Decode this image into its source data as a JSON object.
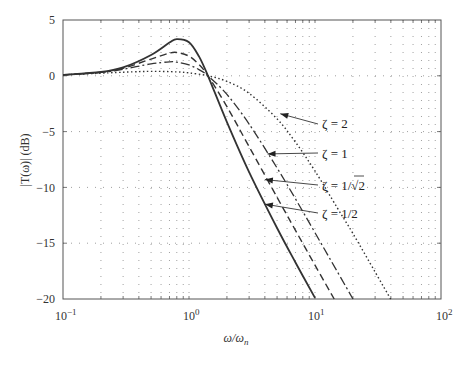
{
  "chart_data": {
    "type": "line",
    "title": "",
    "xlabel": "ω/ωn",
    "ylabel": "|T(ω)| (dB)",
    "xscale": "log",
    "xlim": [
      0.1,
      100
    ],
    "ylim": [
      -20,
      5
    ],
    "grid": true,
    "x_ticks": [
      "10^-1",
      "10^0",
      "10^1",
      "10^2"
    ],
    "y_ticks": [
      "5",
      "0",
      "-5",
      "-10",
      "-15",
      "-20"
    ],
    "series": [
      {
        "name": "ζ = 2",
        "style": "dotted",
        "x": [
          0.1,
          0.3,
          0.5,
          0.8,
          1,
          1.414,
          2,
          3,
          5,
          7,
          10,
          15,
          20,
          30,
          40
        ],
        "y": [
          0.08,
          0.32,
          0.4,
          0.35,
          0.26,
          0,
          -0.5,
          -1.57,
          -3.86,
          -5.95,
          -8.53,
          -11.82,
          -14.13,
          -17.58,
          -20.04
        ]
      },
      {
        "name": "ζ = 1",
        "style": "dash-dot",
        "x": [
          0.1,
          0.2,
          0.3,
          0.5,
          0.7,
          0.8,
          1,
          1.2,
          1.414,
          2,
          3,
          5,
          7,
          10,
          15,
          20
        ],
        "y": [
          0.08,
          0.3,
          0.59,
          1.07,
          1.25,
          1.22,
          0.97,
          0.55,
          0,
          -1.67,
          -4.32,
          -8.26,
          -11.03,
          -14.06,
          -17.53,
          -20.0
        ]
      },
      {
        "name": "ζ = 1/√2",
        "style": "dashed",
        "x": [
          0.1,
          0.2,
          0.3,
          0.5,
          0.7,
          0.8,
          1,
          1.2,
          1.414,
          2,
          3,
          5,
          7,
          10,
          14.2
        ],
        "y": [
          0.09,
          0.33,
          0.68,
          1.5,
          2.03,
          2.09,
          1.76,
          1.01,
          0,
          -2.76,
          -6.35,
          -10.89,
          -13.85,
          -16.97,
          -20.0
        ]
      },
      {
        "name": "ζ = 1/2",
        "style": "solid",
        "x": [
          0.1,
          0.2,
          0.3,
          0.5,
          0.7,
          0.8,
          1,
          1.2,
          1.414,
          2,
          3,
          5,
          7,
          10
        ],
        "y": [
          0.09,
          0.34,
          0.75,
          1.87,
          2.98,
          3.29,
          3.01,
          1.74,
          0,
          -4.15,
          -8.63,
          -13.64,
          -16.73,
          -19.9
        ]
      }
    ],
    "annotations": [
      {
        "text": "ζ = 2",
        "arrow_to": [
          5.3,
          -3.4
        ]
      },
      {
        "text": "ζ = 1",
        "arrow_to": [
          4.2,
          -7.0
        ]
      },
      {
        "text": "ζ = 1/√2",
        "arrow_to": [
          4.0,
          -9.3
        ]
      },
      {
        "text": "ζ = 1/2",
        "arrow_to": [
          4.0,
          -11.5
        ]
      }
    ]
  },
  "labels": {
    "y5": "5",
    "y0": "0",
    "ym5": "−5",
    "ym10": "−10",
    "ym15": "−15",
    "ym20": "−20",
    "xbase": "10",
    "xe_m1": "−1",
    "xe_0": "0",
    "xe_1": "1",
    "xe_2": "2",
    "ylabel": "|T(ω)| (dB)",
    "xlabel_main": "ω/ω",
    "xlabel_sub": "n",
    "ann_z2": "ζ = 2",
    "ann_z1": "ζ = 1",
    "ann_zr2_pre": "ζ = 1/",
    "ann_zr2_rad": "√2",
    "ann_zh": "ζ = 1/2"
  }
}
